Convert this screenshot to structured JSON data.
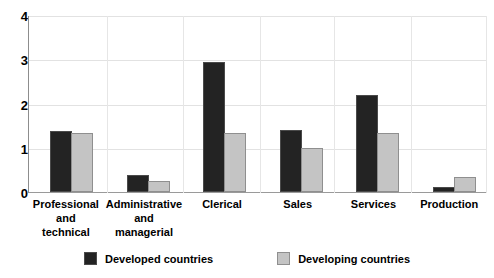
{
  "chart_data": {
    "type": "bar",
    "title": "",
    "subtitle": "",
    "xlabel": "",
    "ylabel": "",
    "ylim": [
      0,
      4
    ],
    "yticks": [
      "0",
      "1",
      "2",
      "3",
      "4"
    ],
    "grid": true,
    "legend_position": "bottom",
    "categories": [
      "Professional and technical",
      "Administrative and managerial",
      "Clerical",
      "Sales",
      "Services",
      "Production"
    ],
    "category_label_lines": [
      [
        "Professional",
        "and",
        "technical"
      ],
      [
        "Administrative",
        "and",
        "managerial"
      ],
      [
        "Clerical"
      ],
      [
        "Sales"
      ],
      [
        "Services"
      ],
      [
        "Production"
      ]
    ],
    "series": [
      {
        "name": "Developed countries",
        "color": "#232323",
        "values": [
          1.38,
          0.38,
          2.95,
          1.4,
          2.2,
          0.12
        ]
      },
      {
        "name": "Developing countries",
        "color": "#c4c4c4",
        "values": [
          1.35,
          0.25,
          1.33,
          1.0,
          1.33,
          0.35
        ]
      }
    ]
  },
  "legend": {
    "items": [
      {
        "label": "Developed countries",
        "swatch": "dev"
      },
      {
        "label": "Developing countries",
        "swatch": "ding"
      }
    ]
  }
}
